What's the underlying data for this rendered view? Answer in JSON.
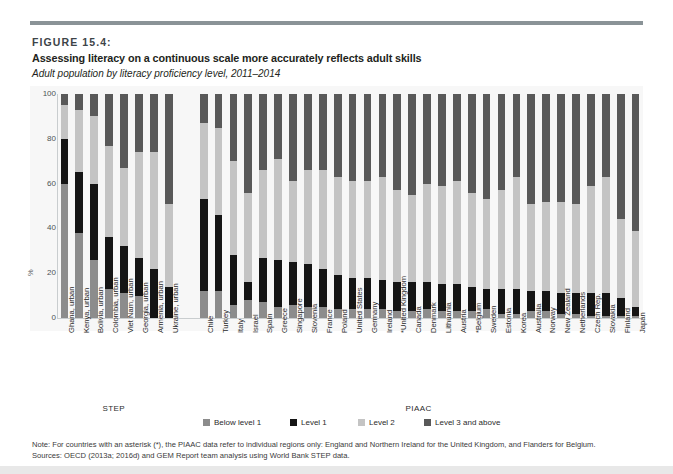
{
  "figure": {
    "label": "FIGURE 15.4:",
    "title": "Assessing literacy on a continuous scale more accurately reflects adult skills",
    "subtitle": "Adult population by literacy proficiency level, 2011–2014"
  },
  "notes": {
    "note": "Note: For countries with an asterisk (*), the PIAAC data refer to individual regions only: England and Northern Ireland for the United Kingdom, and Flanders for Belgium.",
    "sources": "Sources: OECD (2013a; 2016d) and GEM Report team analysis using World Bank STEP data."
  },
  "colors": {
    "below_level_1": "#8c8c8c",
    "level_1": "#151515",
    "level_2": "#c4c4c4",
    "level_3_and_above": "#595959",
    "plot_background": "#f7f7f7",
    "rule": "#8a9397",
    "axis": "#c9cdcf"
  },
  "legend": {
    "items": [
      {
        "label": "Below level 1",
        "color_key": "below_level_1"
      },
      {
        "label": "Level 1",
        "color_key": "level_1"
      },
      {
        "label": "Level 2",
        "color_key": "level_2"
      },
      {
        "label": "Level 3 and above",
        "color_key": "level_3_and_above"
      }
    ]
  },
  "groups": [
    {
      "name": "STEP",
      "count": 8
    },
    {
      "name": "PIAAC",
      "count": 29
    }
  ],
  "chart_data": {
    "type": "bar",
    "subtype": "stacked-vertical-100",
    "title": "Assessing literacy on a continuous scale more accurately reflects adult skills",
    "subtitle": "Adult population by literacy proficiency level, 2011–2014",
    "xlabel": "",
    "ylabel": "%",
    "ylim": [
      0,
      100
    ],
    "yticks": [
      0,
      20,
      40,
      60,
      80,
      100
    ],
    "grid": false,
    "legend_position": "bottom",
    "stack_order_bottom_to_top": [
      "Below level 1",
      "Level 1",
      "Level 2",
      "Level 3 and above"
    ],
    "series": [
      {
        "name": "Below level 1",
        "color_key": "below_level_1"
      },
      {
        "name": "Level 1",
        "color_key": "level_1"
      },
      {
        "name": "Level 2",
        "color_key": "level_2"
      },
      {
        "name": "Level 3 and above",
        "color_key": "level_3_and_above"
      }
    ],
    "categories": [
      "Ghana, urban",
      "Kenya, urban",
      "Bolivia, urban",
      "Colombia, urban",
      "Viet Nam, urban",
      "Georgia, urban",
      "Armenia, urban",
      "Ukraine, urban",
      "Chile",
      "Turkey",
      "Italy",
      "Israel",
      "Spain",
      "Greece",
      "Singapore",
      "Slovenia",
      "France",
      "Poland",
      "United States",
      "Germany",
      "Ireland",
      "*United Kingdom",
      "Canada",
      "Denmark",
      "Lithuania",
      "Austria",
      "*Belgium",
      "Sweden",
      "Estonia",
      "Korea",
      "Australia",
      "Norway",
      "New Zealand",
      "Netherlands",
      "Czech Rep.",
      "Slovakia",
      "Finland",
      "Japan"
    ],
    "groups": [
      "STEP",
      "STEP",
      "STEP",
      "STEP",
      "STEP",
      "STEP",
      "STEP",
      "STEP",
      "PIAAC",
      "PIAAC",
      "PIAAC",
      "PIAAC",
      "PIAAC",
      "PIAAC",
      "PIAAC",
      "PIAAC",
      "PIAAC",
      "PIAAC",
      "PIAAC",
      "PIAAC",
      "PIAAC",
      "PIAAC",
      "PIAAC",
      "PIAAC",
      "PIAAC",
      "PIAAC",
      "PIAAC",
      "PIAAC",
      "PIAAC",
      "PIAAC",
      "PIAAC",
      "PIAAC",
      "PIAAC",
      "PIAAC",
      "PIAAC",
      "PIAAC",
      "PIAAC",
      "PIAAC"
    ],
    "bars": [
      {
        "category": "Ghana, urban",
        "below_level_1": 60,
        "level_1": 20,
        "level_2": 15,
        "level_3_and_above": 5
      },
      {
        "category": "Kenya, urban",
        "below_level_1": 38,
        "level_1": 27,
        "level_2": 28,
        "level_3_and_above": 7
      },
      {
        "category": "Bolivia, urban",
        "below_level_1": 26,
        "level_1": 34,
        "level_2": 30,
        "level_3_and_above": 10
      },
      {
        "category": "Colombia, urban",
        "below_level_1": 13,
        "level_1": 23,
        "level_2": 41,
        "level_3_and_above": 23
      },
      {
        "category": "Viet Nam, urban",
        "below_level_1": 11,
        "level_1": 21,
        "level_2": 35,
        "level_3_and_above": 33
      },
      {
        "category": "Georgia, urban",
        "below_level_1": 10,
        "level_1": 17,
        "level_2": 47,
        "level_3_and_above": 26
      },
      {
        "category": "Armenia, urban",
        "below_level_1": 0,
        "level_1": 22,
        "level_2": 52,
        "level_3_and_above": 26
      },
      {
        "category": "Ukraine, urban",
        "below_level_1": 0,
        "level_1": 14,
        "level_2": 37,
        "level_3_and_above": 49
      },
      {
        "category": "Chile",
        "below_level_1": 12,
        "level_1": 41,
        "level_2": 34,
        "level_3_and_above": 13
      },
      {
        "category": "Turkey",
        "below_level_1": 12,
        "level_1": 34,
        "level_2": 39,
        "level_3_and_above": 15
      },
      {
        "category": "Italy",
        "below_level_1": 6,
        "level_1": 22,
        "level_2": 42,
        "level_3_and_above": 30
      },
      {
        "category": "Israel",
        "below_level_1": 8,
        "level_1": 8,
        "level_2": 40,
        "level_3_and_above": 44
      },
      {
        "category": "Spain",
        "below_level_1": 7,
        "level_1": 20,
        "level_2": 39,
        "level_3_and_above": 34
      },
      {
        "category": "Greece",
        "below_level_1": 5,
        "level_1": 21,
        "level_2": 45,
        "level_3_and_above": 29
      },
      {
        "category": "Singapore",
        "below_level_1": 6,
        "level_1": 19,
        "level_2": 36,
        "level_3_and_above": 39
      },
      {
        "category": "Slovenia",
        "below_level_1": 5,
        "level_1": 19,
        "level_2": 42,
        "level_3_and_above": 34
      },
      {
        "category": "France",
        "below_level_1": 5,
        "level_1": 17,
        "level_2": 44,
        "level_3_and_above": 34
      },
      {
        "category": "Poland",
        "below_level_1": 4,
        "level_1": 15,
        "level_2": 44,
        "level_3_and_above": 37
      },
      {
        "category": "United States",
        "below_level_1": 4,
        "level_1": 14,
        "level_2": 43,
        "level_3_and_above": 39
      },
      {
        "category": "Germany",
        "below_level_1": 4,
        "level_1": 14,
        "level_2": 43,
        "level_3_and_above": 39
      },
      {
        "category": "Ireland",
        "below_level_1": 4,
        "level_1": 13,
        "level_2": 46,
        "level_3_and_above": 37
      },
      {
        "category": "*United Kingdom",
        "below_level_1": 3,
        "level_1": 13,
        "level_2": 41,
        "level_3_and_above": 43
      },
      {
        "category": "Canada",
        "below_level_1": 3,
        "level_1": 13,
        "level_2": 39,
        "level_3_and_above": 45
      },
      {
        "category": "Denmark",
        "below_level_1": 4,
        "level_1": 12,
        "level_2": 44,
        "level_3_and_above": 40
      },
      {
        "category": "Lithuania",
        "below_level_1": 3,
        "level_1": 12,
        "level_2": 44,
        "level_3_and_above": 41
      },
      {
        "category": "Austria",
        "below_level_1": 3,
        "level_1": 12,
        "level_2": 46,
        "level_3_and_above": 39
      },
      {
        "category": "*Belgium",
        "below_level_1": 3,
        "level_1": 11,
        "level_2": 42,
        "level_3_and_above": 44
      },
      {
        "category": "Sweden",
        "below_level_1": 4,
        "level_1": 9,
        "level_2": 40,
        "level_3_and_above": 47
      },
      {
        "category": "Estonia",
        "below_level_1": 2,
        "level_1": 11,
        "level_2": 44,
        "level_3_and_above": 43
      },
      {
        "category": "Korea",
        "below_level_1": 2,
        "level_1": 11,
        "level_2": 50,
        "level_3_and_above": 37
      },
      {
        "category": "Australia",
        "below_level_1": 3,
        "level_1": 9,
        "level_2": 39,
        "level_3_and_above": 49
      },
      {
        "category": "Norway",
        "below_level_1": 3,
        "level_1": 9,
        "level_2": 40,
        "level_3_and_above": 48
      },
      {
        "category": "New Zealand",
        "below_level_1": 2,
        "level_1": 9,
        "level_2": 41,
        "level_3_and_above": 48
      },
      {
        "category": "Netherlands",
        "below_level_1": 2,
        "level_1": 9,
        "level_2": 40,
        "level_3_and_above": 49
      },
      {
        "category": "Czech Rep.",
        "below_level_1": 1,
        "level_1": 10,
        "level_2": 48,
        "level_3_and_above": 41
      },
      {
        "category": "Slovakia",
        "below_level_1": 1,
        "level_1": 10,
        "level_2": 52,
        "level_3_and_above": 37
      },
      {
        "category": "Finland",
        "below_level_1": 1,
        "level_1": 8,
        "level_2": 35,
        "level_3_and_above": 56
      },
      {
        "category": "Japan",
        "below_level_1": 1,
        "level_1": 4,
        "level_2": 34,
        "level_3_and_above": 61
      }
    ]
  }
}
